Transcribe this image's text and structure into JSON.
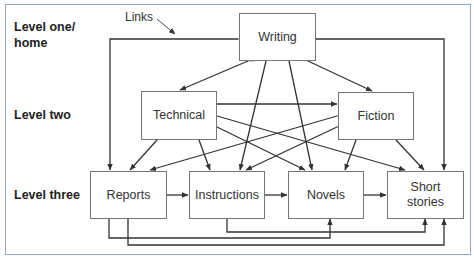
{
  "levels": {
    "one": "Level one/\nhome",
    "one_line1": "Level one/",
    "one_line2": "home",
    "two": "Level two",
    "three": "Level three"
  },
  "annotation": {
    "links": "Links"
  },
  "nodes": {
    "writing": "Writing",
    "technical": "Technical",
    "fiction": "Fiction",
    "reports": "Reports",
    "instructions": "Instructions",
    "novels": "Novels",
    "short_stories_line1": "Short",
    "short_stories_line2": "stories"
  },
  "colors": {
    "frame_border": "#8fa6cf",
    "line": "#333333",
    "box_border": "#777777"
  },
  "edges": [
    [
      "Writing",
      "Technical"
    ],
    [
      "Writing",
      "Fiction"
    ],
    [
      "Writing",
      "Reports"
    ],
    [
      "Writing",
      "Short stories"
    ],
    [
      "Writing",
      "Instructions"
    ],
    [
      "Writing",
      "Novels"
    ],
    [
      "Technical",
      "Fiction"
    ],
    [
      "Technical",
      "Reports"
    ],
    [
      "Technical",
      "Instructions"
    ],
    [
      "Technical",
      "Novels"
    ],
    [
      "Technical",
      "Short stories"
    ],
    [
      "Fiction",
      "Reports"
    ],
    [
      "Fiction",
      "Instructions"
    ],
    [
      "Fiction",
      "Novels"
    ],
    [
      "Fiction",
      "Short stories"
    ],
    [
      "Reports",
      "Instructions"
    ],
    [
      "Instructions",
      "Novels"
    ],
    [
      "Novels",
      "Short stories"
    ],
    [
      "Reports",
      "Novels"
    ],
    [
      "Reports",
      "Short stories"
    ],
    [
      "Instructions",
      "Short stories"
    ]
  ]
}
